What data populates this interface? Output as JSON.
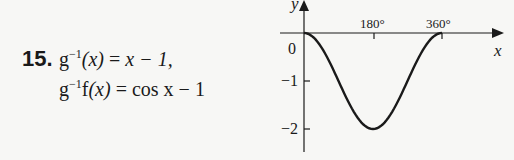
{
  "problem": {
    "number": "15.",
    "line1": {
      "fn": "g",
      "sup": "−1",
      "arg": "(x)",
      "eq": " = ",
      "rhs": "x − 1,"
    },
    "line2": {
      "fn": "g",
      "sup": "−1",
      "fn2": "f",
      "arg": "(x)",
      "eq": " = ",
      "rhs": "cos x − 1"
    }
  },
  "graph": {
    "x_label": "x",
    "y_label": "y",
    "origin_label": "0",
    "x_ticks": [
      "180°",
      "360°"
    ],
    "y_ticks": [
      "−1",
      "−2"
    ]
  },
  "chart_data": {
    "type": "line",
    "title": "",
    "xlabel": "x",
    "ylabel": "y",
    "x_tick_labels": [
      "180°",
      "360°"
    ],
    "y_tick_labels": [
      "0",
      "−1",
      "−2"
    ],
    "series": [
      {
        "name": "y = cos x − 1",
        "x": [
          0,
          45,
          90,
          135,
          180,
          225,
          270,
          315,
          360
        ],
        "y": [
          0,
          -0.29,
          -1,
          -1.71,
          -2,
          -1.71,
          -1,
          -0.29,
          0
        ]
      }
    ],
    "xlim": [
      0,
      360
    ],
    "ylim": [
      -2.5,
      0.5
    ],
    "grid": false,
    "legend": "none"
  }
}
